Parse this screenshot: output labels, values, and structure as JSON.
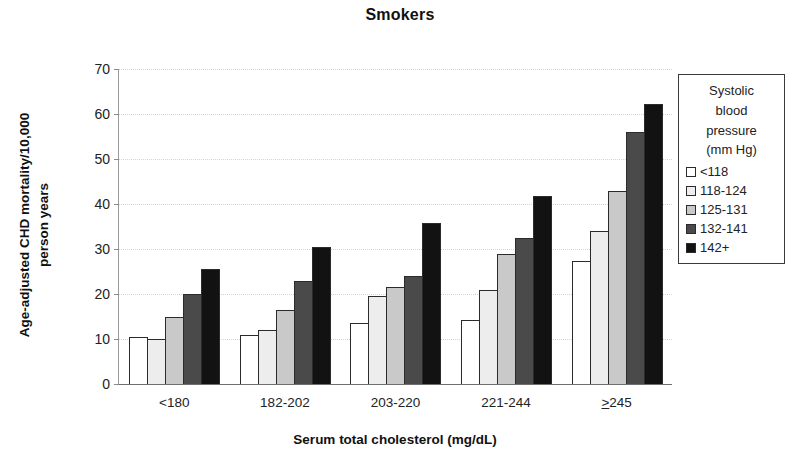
{
  "chart_data": {
    "type": "bar",
    "title": "Smokers",
    "xlabel": "Serum total cholesterol (mg/dL)",
    "ylabel": "Age-adjusted CHD mortality/10,000 person years",
    "ylim": [
      0,
      70
    ],
    "yticks": [
      0,
      10,
      20,
      30,
      40,
      50,
      60,
      70
    ],
    "grid": true,
    "legend_position": "right",
    "legend_title": "Systolic blood pressure (mm Hg)",
    "categories": [
      "<180",
      "182-202",
      "203-220",
      "221-244",
      "≥245"
    ],
    "series": [
      {
        "name": "<118",
        "color": "#ffffff",
        "values": [
          10.5,
          11.0,
          13.5,
          14.3,
          27.3
        ]
      },
      {
        "name": "118-124",
        "color": "#ededed",
        "values": [
          10.0,
          12.0,
          19.5,
          21.0,
          34.0
        ]
      },
      {
        "name": "125-131",
        "color": "#c9c9c9",
        "values": [
          15.0,
          16.5,
          21.5,
          29.0,
          43.0
        ]
      },
      {
        "name": "132-141",
        "color": "#4a4a4a",
        "values": [
          20.0,
          23.0,
          24.0,
          32.5,
          56.0
        ]
      },
      {
        "name": "142+",
        "color": "#121212",
        "values": [
          25.5,
          30.5,
          35.8,
          41.8,
          62.3
        ]
      }
    ]
  },
  "title": "Smokers",
  "axes": {
    "y_title": "Age-adjusted CHD mortality/10,000 person years",
    "x_title": "Serum total cholesterol (mg/dL)",
    "y_ticks": [
      "70",
      "60",
      "50",
      "40",
      "30",
      "20",
      "10",
      "0"
    ],
    "x_categories": [
      "<180",
      "182-202",
      "203-220",
      "221-244",
      "≥245"
    ]
  },
  "legend": {
    "title_lines": [
      "Systolic",
      "blood",
      "pressure",
      "(mm Hg)"
    ],
    "entries": [
      {
        "label": "<118",
        "color": "#ffffff"
      },
      {
        "label": "118-124",
        "color": "#ededed"
      },
      {
        "label": "125-131",
        "color": "#c9c9c9"
      },
      {
        "label": "132-141",
        "color": "#4a4a4a"
      },
      {
        "label": "142+",
        "color": "#121212"
      }
    ]
  }
}
